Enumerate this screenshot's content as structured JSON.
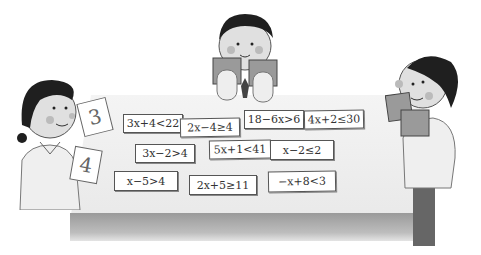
{
  "scene": {
    "description": "Three children reading books around a table covered with inequality cards",
    "colors": {
      "background": "#ffffff",
      "table_top": "#eeeeee",
      "table_edge": "#a5a5a5",
      "card_border": "#555555",
      "hair": "#1f1f1f",
      "skin": "#d9d9d9",
      "cheek": "#b5b5b5"
    }
  },
  "girl": {
    "held_cards": [
      "3",
      "4"
    ]
  },
  "cards": [
    {
      "id": "c1",
      "text": "3x+4<22"
    },
    {
      "id": "c2",
      "text": "2x−4≥4"
    },
    {
      "id": "c3",
      "text": "18−6x>6"
    },
    {
      "id": "c4",
      "text": "4x+2≤30"
    },
    {
      "id": "c5",
      "text": "3x−2>4"
    },
    {
      "id": "c6",
      "text": "5x+1<41"
    },
    {
      "id": "c7",
      "text": "x−2≤2"
    },
    {
      "id": "c8",
      "text": "x−5>4"
    },
    {
      "id": "c9",
      "text": "2x+5≥11"
    },
    {
      "id": "c10",
      "text": "−x+8<3"
    }
  ]
}
